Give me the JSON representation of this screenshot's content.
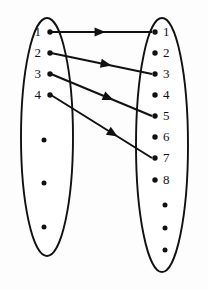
{
  "diagram": {
    "type": "function-mapping",
    "background_color": "#fdfdfd",
    "ink_color": "#111111",
    "domain_set": {
      "name": "left-set",
      "label": "",
      "ellipse": {
        "cx": 47,
        "cy": 137,
        "rx": 26,
        "ry": 119
      },
      "elements": [
        {
          "label": "1",
          "x": 50,
          "y": 32,
          "label_x": 41,
          "label_y": 36
        },
        {
          "label": "2",
          "x": 50,
          "y": 53,
          "label_x": 41,
          "label_y": 57
        },
        {
          "label": "3",
          "x": 50,
          "y": 74,
          "label_x": 41,
          "label_y": 78
        },
        {
          "label": "4",
          "x": 50,
          "y": 95,
          "label_x": 41,
          "label_y": 99
        }
      ],
      "continuation_dots": [
        {
          "x": 44,
          "y": 140
        },
        {
          "x": 44,
          "y": 183
        },
        {
          "x": 44,
          "y": 227
        }
      ]
    },
    "codomain_set": {
      "name": "right-set",
      "label": "",
      "ellipse": {
        "cx": 162,
        "cy": 145,
        "rx": 26,
        "ry": 127
      },
      "elements": [
        {
          "label": "1",
          "x": 155,
          "y": 32,
          "label_x": 163,
          "label_y": 36
        },
        {
          "label": "2",
          "x": 155,
          "y": 53,
          "label_x": 163,
          "label_y": 57
        },
        {
          "label": "3",
          "x": 155,
          "y": 74,
          "label_x": 163,
          "label_y": 78
        },
        {
          "label": "4",
          "x": 155,
          "y": 95,
          "label_x": 163,
          "label_y": 99
        },
        {
          "label": "5",
          "x": 155,
          "y": 116,
          "label_x": 163,
          "label_y": 120
        },
        {
          "label": "6",
          "x": 155,
          "y": 137,
          "label_x": 163,
          "label_y": 141
        },
        {
          "label": "7",
          "x": 155,
          "y": 158,
          "label_x": 163,
          "label_y": 162
        },
        {
          "label": "8",
          "x": 155,
          "y": 180,
          "label_x": 163,
          "label_y": 184
        }
      ],
      "continuation_dots": [
        {
          "x": 165,
          "y": 205
        },
        {
          "x": 165,
          "y": 228
        },
        {
          "x": 165,
          "y": 250
        }
      ]
    },
    "arrows": [
      {
        "name": "arrow-1-to-1",
        "from_label": "1",
        "to_label": "1",
        "x1": 51,
        "y1": 32,
        "x2": 152,
        "y2": 32,
        "head_t": 0.54
      },
      {
        "name": "arrow-2-to-3",
        "from_label": "2",
        "to_label": "3",
        "x1": 51,
        "y1": 53,
        "x2": 152,
        "y2": 74,
        "head_t": 0.6
      },
      {
        "name": "arrow-3-to-5",
        "from_label": "3",
        "to_label": "5",
        "x1": 51,
        "y1": 74,
        "x2": 152,
        "y2": 116,
        "head_t": 0.62
      },
      {
        "name": "arrow-4-to-7",
        "from_label": "4",
        "to_label": "7",
        "x1": 51,
        "y1": 95,
        "x2": 152,
        "y2": 158,
        "head_t": 0.66
      }
    ]
  },
  "chart_data": {
    "type": "diagram",
    "mappings": [
      {
        "from": 1,
        "to": 1
      },
      {
        "from": 2,
        "to": 3
      },
      {
        "from": 3,
        "to": 5
      },
      {
        "from": 4,
        "to": 7
      }
    ],
    "domain_visible_elements": [
      "1",
      "2",
      "3",
      "4"
    ],
    "codomain_visible_elements": [
      "1",
      "2",
      "3",
      "4",
      "5",
      "6",
      "7",
      "8"
    ],
    "domain_has_ellipsis": true,
    "codomain_has_ellipsis": true,
    "rule": "n maps to 2n-1"
  }
}
